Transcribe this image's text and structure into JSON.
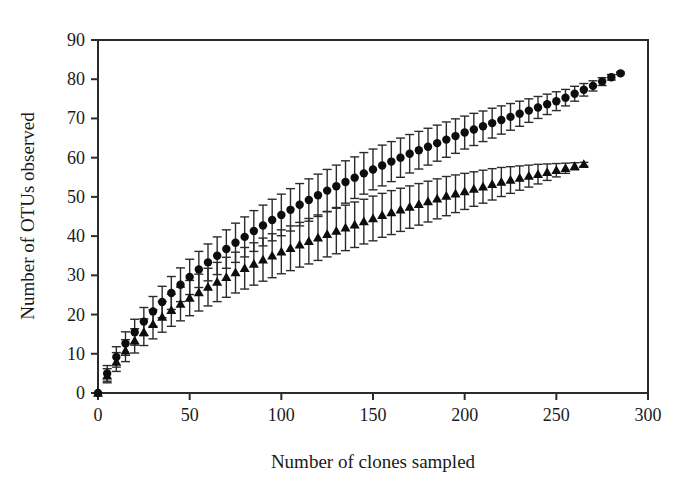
{
  "figure": {
    "background_color": "#ffffff",
    "axis_color": "#2b2b2b",
    "marker_color": "#0d0d0d"
  },
  "chart_data": {
    "type": "line",
    "title": "",
    "subtitle": "",
    "xlabel": "Number of clones sampled",
    "ylabel": "Number of OTUs observed",
    "xlim": [
      0,
      300
    ],
    "ylim": [
      0,
      90
    ],
    "xticks": [
      0,
      50,
      100,
      150,
      200,
      250,
      300
    ],
    "yticks": [
      0,
      10,
      20,
      30,
      40,
      50,
      60,
      70,
      80,
      90
    ],
    "xtick_labels": [
      "0",
      "50",
      "100",
      "150",
      "200",
      "250",
      "300"
    ],
    "ytick_labels": [
      "0",
      "10",
      "20",
      "30",
      "40",
      "50",
      "60",
      "70",
      "80",
      "90"
    ],
    "grid": false,
    "legend": false,
    "legend_position": "none",
    "annotations": [],
    "error_bars": "vertical, symmetric, with caps (95% confidence interval)",
    "series": [
      {
        "name": "Series 1 (filled circles)",
        "marker": "circle",
        "color": "#0d0d0d",
        "x": [
          0,
          5,
          10,
          15,
          20,
          25,
          30,
          35,
          40,
          45,
          50,
          55,
          60,
          65,
          70,
          75,
          80,
          85,
          90,
          95,
          100,
          105,
          110,
          115,
          120,
          125,
          130,
          135,
          140,
          145,
          150,
          155,
          160,
          165,
          170,
          175,
          180,
          185,
          190,
          195,
          200,
          205,
          210,
          215,
          220,
          225,
          230,
          235,
          240,
          245,
          250,
          255,
          260,
          265,
          270,
          275,
          280,
          285
        ],
        "values": [
          0,
          5.0,
          9.2,
          12.6,
          15.5,
          18.2,
          20.8,
          23.2,
          25.5,
          27.6,
          29.6,
          31.5,
          33.3,
          35.0,
          36.7,
          38.3,
          39.8,
          41.3,
          42.7,
          44.1,
          45.4,
          46.7,
          48.0,
          49.2,
          50.4,
          51.6,
          52.7,
          53.8,
          54.9,
          56.0,
          57.0,
          58.0,
          59.0,
          60.0,
          61.0,
          61.9,
          62.8,
          63.7,
          64.6,
          65.5,
          66.4,
          67.2,
          68.0,
          68.8,
          69.6,
          70.4,
          71.2,
          72.0,
          72.8,
          73.6,
          74.4,
          75.3,
          76.3,
          77.3,
          78.3,
          79.4,
          80.5,
          81.5
        ],
        "err": [
          0,
          2.0,
          2.6,
          3.0,
          3.3,
          3.6,
          3.8,
          4.0,
          4.2,
          4.3,
          4.5,
          4.6,
          4.7,
          4.8,
          4.9,
          5.0,
          5.1,
          5.2,
          5.2,
          5.3,
          5.3,
          5.4,
          5.4,
          5.4,
          5.4,
          5.4,
          5.4,
          5.4,
          5.3,
          5.3,
          5.2,
          5.2,
          5.1,
          5.0,
          4.9,
          4.8,
          4.7,
          4.6,
          4.5,
          4.4,
          4.2,
          4.1,
          3.9,
          3.8,
          3.6,
          3.4,
          3.2,
          3.0,
          2.8,
          2.6,
          2.4,
          2.1,
          1.9,
          1.6,
          1.3,
          1.0,
          0.7,
          0.3
        ]
      },
      {
        "name": "Series 2 (filled triangles)",
        "marker": "triangle",
        "color": "#0d0d0d",
        "x": [
          0,
          5,
          10,
          15,
          20,
          25,
          30,
          35,
          40,
          45,
          50,
          55,
          60,
          65,
          70,
          75,
          80,
          85,
          90,
          95,
          100,
          105,
          110,
          115,
          120,
          125,
          130,
          135,
          140,
          145,
          150,
          155,
          160,
          165,
          170,
          175,
          180,
          185,
          190,
          195,
          200,
          205,
          210,
          215,
          220,
          225,
          230,
          235,
          240,
          245,
          250,
          255,
          260,
          265
        ],
        "values": [
          0,
          4.4,
          7.9,
          10.8,
          13.3,
          15.5,
          17.5,
          19.4,
          21.1,
          22.7,
          24.2,
          25.6,
          27.0,
          28.3,
          29.5,
          30.7,
          31.8,
          32.9,
          34.0,
          35.0,
          36.0,
          36.9,
          37.8,
          38.7,
          39.6,
          40.5,
          41.3,
          42.1,
          42.9,
          43.7,
          44.5,
          45.3,
          46.0,
          46.7,
          47.4,
          48.1,
          48.8,
          49.5,
          50.2,
          50.8,
          51.4,
          52.0,
          52.6,
          53.2,
          53.8,
          54.3,
          54.8,
          55.3,
          55.8,
          56.3,
          56.8,
          57.3,
          57.8,
          58.3
        ],
        "err": [
          0,
          1.8,
          2.4,
          2.8,
          3.1,
          3.4,
          3.7,
          3.9,
          4.1,
          4.3,
          4.5,
          4.7,
          4.8,
          5.0,
          5.1,
          5.2,
          5.3,
          5.4,
          5.5,
          5.6,
          5.6,
          5.7,
          5.7,
          5.8,
          5.8,
          5.8,
          5.8,
          5.8,
          5.8,
          5.7,
          5.7,
          5.6,
          5.6,
          5.5,
          5.4,
          5.3,
          5.2,
          5.1,
          5.0,
          4.8,
          4.6,
          4.4,
          4.2,
          4.0,
          3.7,
          3.4,
          3.1,
          2.8,
          2.5,
          2.1,
          1.7,
          1.3,
          0.9,
          0.5
        ]
      }
    ]
  }
}
